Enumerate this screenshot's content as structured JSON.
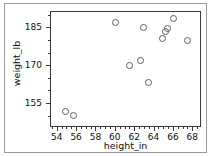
{
  "chart_data": {
    "type": "scatter",
    "title": "",
    "xlabel": "height_in",
    "ylabel": "weight_lb",
    "xlim": [
      53.3,
      68.9
    ],
    "ylim": [
      145.5,
      191.5
    ],
    "xticks": [
      54,
      56,
      58,
      60,
      62,
      64,
      66,
      68
    ],
    "xticklabels": [
      "54",
      "56",
      "58",
      "60",
      "62",
      "64",
      "66",
      "68"
    ],
    "yticks": [
      155,
      170,
      185
    ],
    "yticklabels": [
      "155",
      "170",
      "185"
    ],
    "x_minor_step": 0.5,
    "y_minor_step": 5,
    "grid": false,
    "legend": null,
    "marker": "open-circle",
    "marker_edge_color": "#5d5d5d",
    "marker_face_color": "none",
    "points": [
      {
        "x": 54.9,
        "y": 151.5
      },
      {
        "x": 55.7,
        "y": 150.0
      },
      {
        "x": 60.1,
        "y": 187.0
      },
      {
        "x": 61.5,
        "y": 169.8
      },
      {
        "x": 62.6,
        "y": 172.0
      },
      {
        "x": 63.0,
        "y": 185.0
      },
      {
        "x": 63.5,
        "y": 163.0
      },
      {
        "x": 64.9,
        "y": 180.5
      },
      {
        "x": 65.2,
        "y": 183.5
      },
      {
        "x": 65.4,
        "y": 184.5
      },
      {
        "x": 66.1,
        "y": 188.5
      },
      {
        "x": 67.5,
        "y": 180.0
      }
    ],
    "x": [
      54.9,
      55.7,
      60.1,
      61.5,
      62.6,
      63.0,
      63.5,
      64.9,
      65.2,
      65.4,
      66.1,
      67.5
    ],
    "values": [
      151.5,
      150.0,
      187.0,
      169.8,
      172.0,
      185.0,
      163.0,
      180.5,
      183.5,
      184.5,
      188.5,
      180.0
    ]
  },
  "figure": {
    "background_color": "#ffffff",
    "axis_color": "#3a3a3a",
    "border_color": "#9a9a9a",
    "text_color": "#111111"
  }
}
